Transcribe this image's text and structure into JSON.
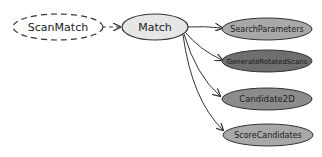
{
  "diagram": {
    "nodes": [
      {
        "id": "scanmatch",
        "label": "ScanMatch",
        "style": "dashed",
        "fill": "#ffffff"
      },
      {
        "id": "match",
        "label": "Match",
        "style": "solid",
        "fill": "#e6e6e6"
      },
      {
        "id": "searchparameters",
        "label": "SearchParameters",
        "style": "solid",
        "fill": "#a8a8a8"
      },
      {
        "id": "generaterotatedscans",
        "label": "GenerateRotatedScans",
        "style": "solid",
        "fill": "#6e6e6e"
      },
      {
        "id": "candidate2d",
        "label": "Candidate2D",
        "style": "solid",
        "fill": "#8c8c8c"
      },
      {
        "id": "scorecandidates",
        "label": "ScoreCandidates",
        "style": "solid",
        "fill": "#a8a8a8"
      }
    ],
    "edges": [
      {
        "from": "scanmatch",
        "to": "match",
        "style": "dashed"
      },
      {
        "from": "match",
        "to": "searchparameters",
        "style": "solid"
      },
      {
        "from": "match",
        "to": "generaterotatedscans",
        "style": "solid"
      },
      {
        "from": "match",
        "to": "candidate2d",
        "style": "solid"
      },
      {
        "from": "match",
        "to": "scorecandidates",
        "style": "solid"
      }
    ]
  }
}
